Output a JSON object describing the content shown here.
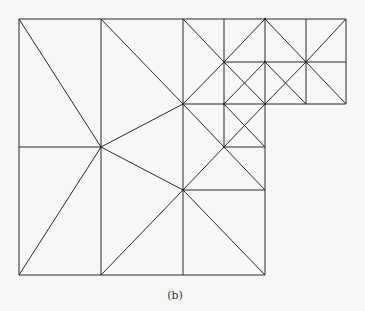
{
  "figure": {
    "caption": "(b)",
    "stroke_color": "#2a2a2a",
    "background": "#f7f7f6"
  },
  "mesh": {
    "nodes": {
      "x": [
        19,
        101,
        183,
        224,
        265,
        306,
        346
      ],
      "y": [
        19,
        62,
        104,
        147,
        190,
        275
      ]
    },
    "edges": [
      [
        19,
        19,
        346,
        19
      ],
      [
        19,
        19,
        19,
        275
      ],
      [
        19,
        275,
        265,
        275
      ],
      [
        265,
        104,
        265,
        275
      ],
      [
        265,
        104,
        346,
        104
      ],
      [
        346,
        19,
        346,
        104
      ],
      [
        101,
        19,
        101,
        275
      ],
      [
        183,
        19,
        183,
        275
      ],
      [
        224,
        19,
        224,
        147
      ],
      [
        265,
        19,
        265,
        104
      ],
      [
        306,
        19,
        306,
        104
      ],
      [
        19,
        147,
        101,
        147
      ],
      [
        224,
        62,
        346,
        62
      ],
      [
        183,
        104,
        265,
        104
      ],
      [
        224,
        147,
        265,
        147
      ],
      [
        183,
        190,
        265,
        190
      ],
      [
        19,
        19,
        101,
        147
      ],
      [
        19,
        275,
        101,
        147
      ],
      [
        101,
        19,
        183,
        104
      ],
      [
        101,
        147,
        183,
        104
      ],
      [
        101,
        147,
        183,
        190
      ],
      [
        101,
        275,
        183,
        190
      ],
      [
        183,
        190,
        265,
        275
      ],
      [
        183,
        19,
        224,
        62
      ],
      [
        224,
        62,
        265,
        19
      ],
      [
        183,
        104,
        224,
        62
      ],
      [
        224,
        62,
        265,
        104
      ],
      [
        224,
        104,
        265,
        62
      ],
      [
        265,
        19,
        306,
        62
      ],
      [
        265,
        62,
        306,
        104
      ],
      [
        265,
        104,
        306,
        62
      ],
      [
        306,
        62,
        346,
        19
      ],
      [
        306,
        62,
        346,
        104
      ],
      [
        183,
        104,
        265,
        190
      ],
      [
        183,
        190,
        224,
        147
      ],
      [
        224,
        104,
        265,
        147
      ],
      [
        224,
        147,
        265,
        104
      ]
    ],
    "vertices_marked": [
      [
        101,
        147
      ],
      [
        183,
        104
      ],
      [
        183,
        190
      ],
      [
        224,
        62
      ],
      [
        265,
        62
      ],
      [
        306,
        62
      ],
      [
        224,
        104
      ],
      [
        265,
        104
      ],
      [
        224,
        147
      ],
      [
        265,
        19
      ]
    ]
  }
}
